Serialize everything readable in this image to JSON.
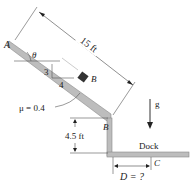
{
  "figure": {
    "labels": {
      "point_a": "A",
      "angle": "θ",
      "slope_rise": "3",
      "slope_run": "4",
      "block": "B",
      "friction": "μ = 0.4",
      "point_b": "B",
      "length": "15 ft",
      "height": "4.5 ft",
      "gravity": "g",
      "dock": "Dock",
      "point_c": "C",
      "distance": "D = ?"
    },
    "colors": {
      "ramp": "#b8b8b8",
      "ramp_edge": "#8a8a8a",
      "block": "#333333",
      "line": "#444444"
    }
  }
}
